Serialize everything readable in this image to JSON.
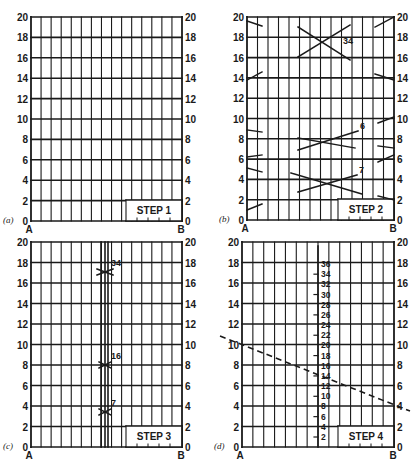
{
  "figure": {
    "ink_color": "#1a1a1a",
    "background": "#ffffff"
  },
  "axis": {
    "ticks": [
      "0",
      "2",
      "4",
      "6",
      "8",
      "10",
      "12",
      "14",
      "16",
      "18",
      "20"
    ],
    "left_label": "A",
    "right_label": "B"
  },
  "panels": [
    {
      "id": "a",
      "caption": "(a)",
      "step_label": "STEP 1",
      "box": {
        "x0": 31,
        "x1": 182,
        "y0": 17,
        "y1": 221
      },
      "columns": 15,
      "extras": []
    },
    {
      "id": "b",
      "caption": "(b)",
      "step_label": "STEP 2",
      "box": {
        "x0": 247,
        "x1": 394,
        "y0": 17,
        "y1": 220
      },
      "columns": 14,
      "crosses": [
        {
          "label": "34",
          "lines": [
            [
              298,
              27,
              350,
              60
            ],
            [
              298,
              57,
              350,
              25
            ]
          ]
        },
        {
          "label": "6",
          "lines": [
            [
              298,
              138,
              355,
              148
            ],
            [
              298,
              150,
              358,
              131
            ]
          ]
        },
        {
          "label": "7",
          "lines": [
            [
              291,
              173,
              362,
              194
            ],
            [
              298,
              192,
              357,
              175
            ]
          ]
        }
      ],
      "left_marks": [
        [
          247,
          21,
          262,
          26
        ],
        [
          247,
          80,
          262,
          72
        ],
        [
          247,
          130,
          262,
          132
        ],
        [
          247,
          157,
          262,
          155
        ],
        [
          247,
          168,
          262,
          172
        ],
        [
          247,
          210,
          262,
          204
        ]
      ],
      "right_marks": [
        [
          375,
          27,
          394,
          17
        ],
        [
          375,
          74,
          394,
          80
        ],
        [
          378,
          123,
          394,
          117
        ],
        [
          378,
          146,
          394,
          148
        ],
        [
          378,
          162,
          394,
          155
        ],
        [
          378,
          196,
          394,
          200
        ]
      ]
    },
    {
      "id": "c",
      "caption": "(c)",
      "step_label": "STEP 3",
      "box": {
        "x0": 31,
        "x1": 182,
        "y0": 242,
        "y1": 447
      },
      "columns": 15,
      "centre_lines": [
        101,
        105,
        108
      ],
      "crosses": [
        {
          "label": "34",
          "y": 272
        },
        {
          "label": "16",
          "y": 365
        },
        {
          "label": "7",
          "y": 412
        }
      ]
    },
    {
      "id": "d",
      "caption": "(d)",
      "step_label": "STEP 4",
      "box": {
        "x0": 242,
        "x1": 394,
        "y0": 242,
        "y1": 447
      },
      "columns": 14,
      "scale_line_x": 318,
      "scale_ticks": [
        "2",
        "4",
        "6",
        "8",
        "10",
        "12",
        "14",
        "16",
        "18",
        "20",
        "22",
        "24",
        "26",
        "28",
        "30",
        "32",
        "34",
        "36"
      ],
      "dashed_line": [
        220,
        336,
        410,
        411
      ]
    }
  ]
}
